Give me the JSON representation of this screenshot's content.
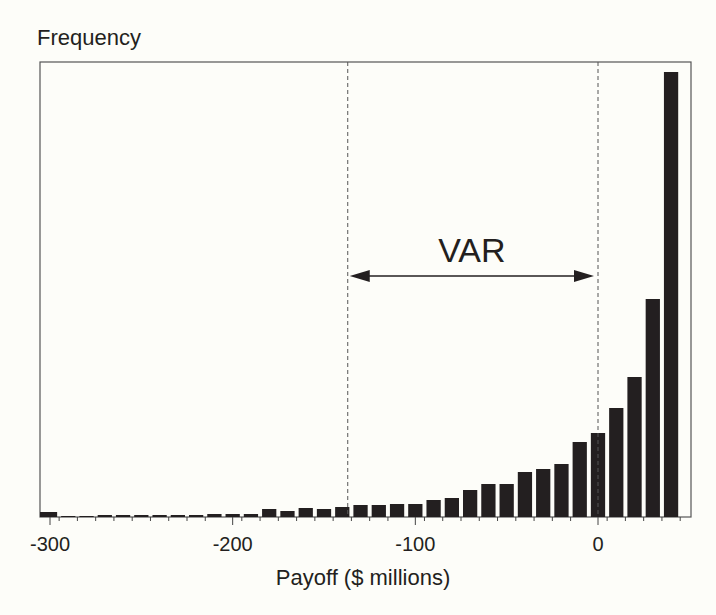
{
  "chart_data": {
    "type": "bar",
    "title": "",
    "ylabel": "Frequency",
    "xlabel": "Payoff ($ millions)",
    "x_ticks": [
      -300,
      -200,
      -100,
      0
    ],
    "xlim": [
      -305,
      50
    ],
    "bin_width": 10,
    "grid": false,
    "legend": null,
    "bar_color": "#231f20",
    "categories": [
      -300,
      -290,
      -280,
      -270,
      -260,
      -250,
      -240,
      -230,
      -220,
      -210,
      -200,
      -190,
      -180,
      -170,
      -160,
      -150,
      -140,
      -130,
      -120,
      -110,
      -100,
      -90,
      -80,
      -70,
      -60,
      -50,
      -40,
      -30,
      -20,
      -10,
      0,
      10,
      20,
      30,
      40
    ],
    "values": [
      5,
      1,
      1,
      2,
      2,
      2,
      2,
      2,
      2,
      3,
      3,
      3,
      8,
      6,
      9,
      8,
      10,
      12,
      12,
      13,
      13,
      17,
      19,
      27,
      33,
      33,
      45,
      48,
      53,
      75,
      84,
      109,
      140,
      218,
      445
    ],
    "value_units": "relative frequency (pixel height, unlabeled axis)",
    "annotations": [
      {
        "type": "vline",
        "x": -137,
        "style": "dashed"
      },
      {
        "type": "vline",
        "x": 0,
        "style": "dashed"
      },
      {
        "type": "double-arrow",
        "from": -137,
        "to": 0,
        "label": "VAR"
      }
    ]
  },
  "labels": {
    "y_axis": "Frequency",
    "x_axis": "Payoff ($ millions)",
    "var": "VAR",
    "ticks": [
      "-300",
      "-200",
      "-100",
      "0"
    ]
  }
}
